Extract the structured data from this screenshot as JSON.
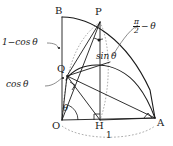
{
  "diagram": {
    "points": {
      "O": {
        "label": "O",
        "x": 62,
        "y": 120
      },
      "A": {
        "label": "A",
        "x": 155,
        "y": 118
      },
      "B": {
        "label": "B",
        "x": 62,
        "y": 17
      },
      "P": {
        "label": "P",
        "x": 100,
        "y": 22
      },
      "Q": {
        "label": "Q",
        "x": 68,
        "y": 75
      },
      "H": {
        "label": "H",
        "x": 100,
        "y": 119
      }
    },
    "labels": {
      "one_minus_cos": "1−cos θ",
      "cos": "cos θ",
      "sin": "sin θ",
      "theta": "θ",
      "unit": "1",
      "pi_over_two_num": "π",
      "pi_over_two_den": "2",
      "minus_theta": "− θ"
    },
    "colors": {
      "stroke": "#1a1a1a",
      "dotted": "#8a8a8a",
      "background": "#ffffff"
    }
  }
}
